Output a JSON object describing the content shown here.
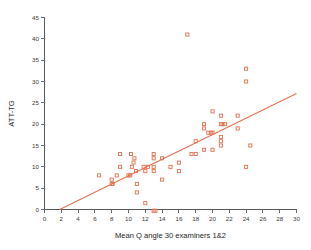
{
  "chart_data": {
    "type": "scatter",
    "title": "",
    "xlabel": "Mean Q angle 30 examiners 1&2",
    "ylabel": "ATT-TG",
    "xlim": [
      0,
      30
    ],
    "ylim": [
      0,
      45
    ],
    "xticks": [
      0,
      2,
      4,
      6,
      8,
      10,
      12,
      14,
      16,
      18,
      20,
      22,
      24,
      26,
      28,
      30
    ],
    "yticks": [
      0,
      5,
      10,
      15,
      20,
      25,
      30,
      35,
      40,
      45
    ],
    "xtick_labels": [
      "0",
      "2",
      "4",
      "6",
      "8",
      "10",
      "12",
      "14",
      "16",
      "18",
      "20",
      "22",
      "24",
      "26",
      "28",
      "30"
    ],
    "ytick_labels": [
      "0",
      "5",
      "10",
      "15",
      "20",
      "25",
      "30",
      "35",
      "40",
      "45"
    ],
    "grid": false,
    "legend": "none",
    "marker_style": "open-square",
    "marker_color": "#e2714f",
    "line_color": "#e2714f",
    "trendline": {
      "type": "linear-fit",
      "x_start": 1.8,
      "y_start": 0.0,
      "x_end": 30.0,
      "y_end": 27.2
    },
    "points": [
      {
        "x": 6.5,
        "y": 8
      },
      {
        "x": 8.0,
        "y": 7
      },
      {
        "x": 8.0,
        "y": 6
      },
      {
        "x": 8.1,
        "y": 6
      },
      {
        "x": 8.6,
        "y": 8
      },
      {
        "x": 9.0,
        "y": 10
      },
      {
        "x": 9.0,
        "y": 13
      },
      {
        "x": 10.0,
        "y": 8
      },
      {
        "x": 10.2,
        "y": 8
      },
      {
        "x": 10.3,
        "y": 13
      },
      {
        "x": 10.4,
        "y": 10
      },
      {
        "x": 10.6,
        "y": 11
      },
      {
        "x": 10.7,
        "y": 12
      },
      {
        "x": 10.9,
        "y": 9
      },
      {
        "x": 11.0,
        "y": 6
      },
      {
        "x": 11.0,
        "y": 4
      },
      {
        "x": 11.8,
        "y": 10
      },
      {
        "x": 12.0,
        "y": 9
      },
      {
        "x": 12.0,
        "y": 1.5
      },
      {
        "x": 12.3,
        "y": 10
      },
      {
        "x": 13.0,
        "y": 13
      },
      {
        "x": 13.0,
        "y": 12
      },
      {
        "x": 13.0,
        "y": 10
      },
      {
        "x": 13.0,
        "y": 9
      },
      {
        "x": 13.0,
        "y": -0.3
      },
      {
        "x": 13.2,
        "y": -0.3
      },
      {
        "x": 14.0,
        "y": 12
      },
      {
        "x": 14.0,
        "y": 7
      },
      {
        "x": 15.0,
        "y": 10
      },
      {
        "x": 16.0,
        "y": 11
      },
      {
        "x": 16.0,
        "y": 9
      },
      {
        "x": 17.0,
        "y": 41
      },
      {
        "x": 17.5,
        "y": 13
      },
      {
        "x": 18.0,
        "y": 16
      },
      {
        "x": 18.0,
        "y": 13
      },
      {
        "x": 19.0,
        "y": 20
      },
      {
        "x": 19.0,
        "y": 19
      },
      {
        "x": 19.0,
        "y": 14
      },
      {
        "x": 19.5,
        "y": 18
      },
      {
        "x": 19.8,
        "y": 18
      },
      {
        "x": 20.0,
        "y": 23
      },
      {
        "x": 20.0,
        "y": 18
      },
      {
        "x": 20.0,
        "y": 14
      },
      {
        "x": 21.0,
        "y": 22
      },
      {
        "x": 21.0,
        "y": 20
      },
      {
        "x": 21.2,
        "y": 20
      },
      {
        "x": 21.5,
        "y": 20
      },
      {
        "x": 21.0,
        "y": 17
      },
      {
        "x": 21.0,
        "y": 16
      },
      {
        "x": 21.0,
        "y": 15
      },
      {
        "x": 23.0,
        "y": 22
      },
      {
        "x": 23.0,
        "y": 19
      },
      {
        "x": 24.0,
        "y": 33
      },
      {
        "x": 24.0,
        "y": 30
      },
      {
        "x": 24.5,
        "y": 15
      },
      {
        "x": 24.0,
        "y": 10
      }
    ]
  },
  "figure": {
    "background": "#ffffff",
    "axis_color": "#555a5e"
  }
}
